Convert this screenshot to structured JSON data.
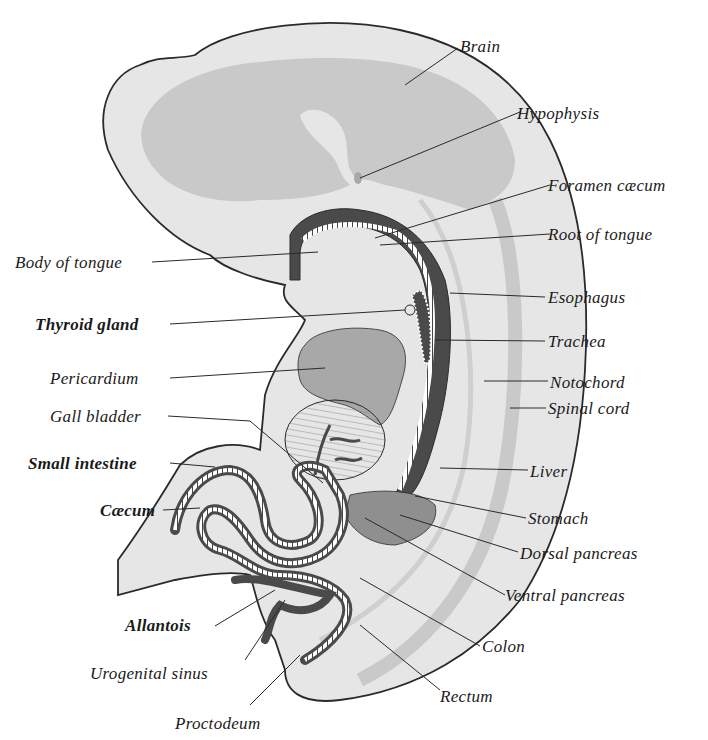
{
  "figure": {
    "colors": {
      "background": "#ffffff",
      "outline": "#2a2a2a",
      "light_tissue": "#e6e6e6",
      "brain_fill": "#c9c9c9",
      "dark_lumen": "#4a4a4a",
      "mid_gray": "#a8a8a8",
      "leader": "#2a2a2a"
    },
    "labels": {
      "brain": "Brain",
      "hypophysis": "Hypophysis",
      "foramen_caecum": "Foramen cæcum",
      "root_of_tongue": "Root of tongue",
      "body_of_tongue": "Body of tongue",
      "esophagus": "Esophagus",
      "thyroid_gland": "Thyroid gland",
      "trachea": "Trachea",
      "pericardium": "Pericardium",
      "notochord": "Notochord",
      "gall_bladder": "Gall bladder",
      "spinal_cord": "Spinal cord",
      "small_intestine": "Small intestine",
      "liver": "Liver",
      "caecum": "Cæcum",
      "stomach": "Stomach",
      "dorsal_pancreas": "Dorsal pancreas",
      "ventral_pancreas": "Ventral pancreas",
      "allantois": "Allantois",
      "colon": "Colon",
      "urogenital_sinus": "Urogenital sinus",
      "rectum": "Rectum",
      "proctodeum": "Proctodeum"
    }
  }
}
